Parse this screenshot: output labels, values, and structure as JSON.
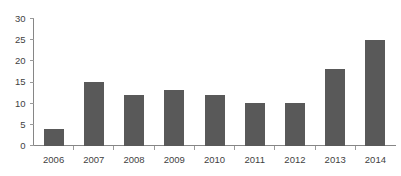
{
  "chart_data": {
    "type": "bar",
    "title": "",
    "subtitle": "",
    "xlabel": "",
    "ylabel": "",
    "categories": [
      "2006",
      "2007",
      "2008",
      "2009",
      "2010",
      "2011",
      "2012",
      "2013",
      "2014"
    ],
    "values": [
      4,
      15,
      12,
      13,
      12,
      10,
      10,
      18,
      25
    ],
    "ylim": [
      0,
      30
    ],
    "yticks": [
      0,
      5,
      10,
      15,
      20,
      25,
      30
    ],
    "ytick_labels": [
      "0",
      "5",
      "10",
      "15",
      "20",
      "25",
      "30"
    ],
    "grid": false,
    "legend": null,
    "legend_position": "none",
    "annotations": [],
    "bar_color": "#595959",
    "axis_color": "#868686",
    "tick_color": "#9a9a9a",
    "label_color": "#3f3f3f",
    "background_color": "#ffffff"
  }
}
